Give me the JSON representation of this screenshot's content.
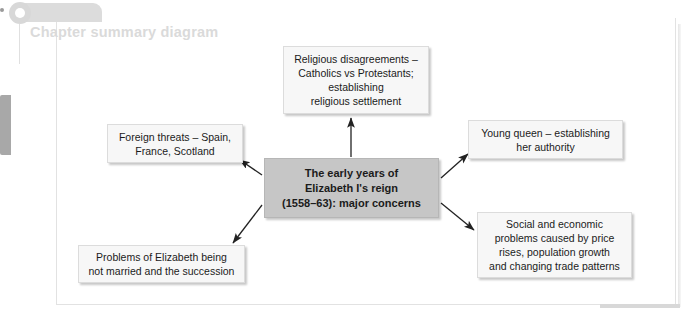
{
  "header": {
    "title": "Chapter summary diagram",
    "ring_icon": "ring-icon"
  },
  "diagram": {
    "type": "summary-diagram",
    "center": {
      "id": "center",
      "text": "The early years of\nElizabeth I's reign\n(1558–63): major concerns",
      "fill": "#c6c6c6",
      "bold": true
    },
    "nodes": [
      {
        "id": "religious",
        "text": "Religious disagreements –\nCatholics vs Protestants;\nestablishing\nreligious settlement",
        "fill": "#f7f7f7",
        "direction": "up"
      },
      {
        "id": "foreign",
        "text": "Foreign threats – Spain,\nFrance, Scotland",
        "fill": "#f7f7f7",
        "direction": "up-left"
      },
      {
        "id": "young",
        "text": "Young queen – establishing\nher authority",
        "fill": "#f7f7f7",
        "direction": "up-right"
      },
      {
        "id": "social",
        "text": "Social and economic\nproblems caused by price\nrises, population growth\nand changing trade patterns",
        "fill": "#f7f7f7",
        "direction": "down-right"
      },
      {
        "id": "problems",
        "text": "Problems of Elizabeth being\nnot married and the succession",
        "fill": "#f7f7f7",
        "direction": "down-left"
      }
    ],
    "arrow_color": "#222222"
  },
  "colors": {
    "page_background": "#ffffff",
    "frame_border": "#e2e2e2",
    "header_text": "#dadada",
    "header_tab": "#dcdcdc",
    "left_tab": "#a8a8a8",
    "box_fill": "#f7f7f7",
    "center_fill": "#c6c6c6"
  }
}
